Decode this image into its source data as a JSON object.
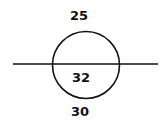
{
  "diagram": {
    "labels": {
      "top": "25",
      "inside_bottom": "32",
      "below": "30"
    },
    "colors": {
      "stroke": "#111111",
      "background": "#ffffff"
    }
  }
}
